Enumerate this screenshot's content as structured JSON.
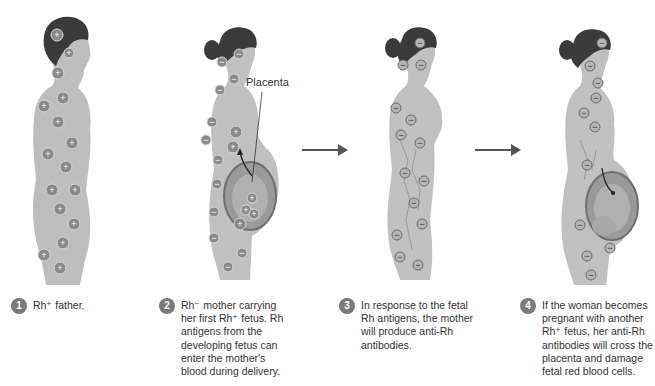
{
  "figure": {
    "labels": {
      "placenta": "Placenta"
    },
    "colors": {
      "skin": "#b9b9b9",
      "hair": "#3a3a3a",
      "marker": "#8a8a8a",
      "arrow": "#555555",
      "badge": "#7a7a7a"
    },
    "panels": [
      {
        "step": "1",
        "caption_lines": [
          "Rh⁺ father."
        ],
        "marker_sign": "+"
      },
      {
        "step": "2",
        "caption_lines": [
          "Rh⁻ mother carrying",
          "her first Rh⁺ fetus. Rh",
          "antigens from the",
          "developing fetus can",
          "enter the mother's",
          "blood during delivery."
        ],
        "marker_sign": "−"
      },
      {
        "step": "3",
        "caption_lines": [
          "In response to the fetal",
          "Rh antigens, the mother",
          "will produce anti-Rh",
          "antibodies."
        ],
        "marker_sign": "−"
      },
      {
        "step": "4",
        "caption_lines": [
          "If the woman becomes",
          "pregnant with another",
          "Rh⁺ fetus, her anti-Rh",
          "antibodies will cross the",
          "placenta and damage",
          "fetal red blood cells."
        ],
        "marker_sign": "−"
      }
    ]
  }
}
